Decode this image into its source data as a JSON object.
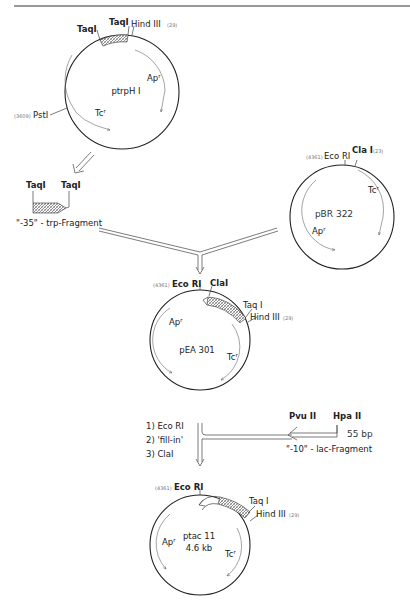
{
  "header": {
    "text": ""
  },
  "plasmids": {
    "ptrpH1": {
      "name": "ptrpH I",
      "sites": {
        "taq1_left": "TaqI",
        "taq1_right": "TaqI",
        "hind3": "Hind III",
        "hind3_pos": "(29)",
        "pst1": "PstI",
        "pst1_pos": "(3609)"
      },
      "genes": {
        "ap": "Ap",
        "tc": "Tc",
        "sup": "r"
      }
    },
    "pBR322": {
      "name": "pBR 322",
      "sites": {
        "ecor1": "Eco RI",
        "ecor1_pos": "(4361)",
        "cla1": "Cla I",
        "cla1_pos": "(23)"
      },
      "genes": {
        "ap": "Ap",
        "tc": "Tc",
        "sup": "r"
      }
    },
    "pEA301": {
      "name": "pEA 301",
      "sites": {
        "ecor1": "Eco RI",
        "ecor1_pos": "(4361)",
        "cla1": "ClaI",
        "taq1": "Taq I",
        "hind3": "Hind III",
        "hind3_pos": "(29)"
      },
      "genes": {
        "ap": "Ap",
        "tc": "Tc",
        "sup": "r"
      }
    },
    "ptac11": {
      "name": "ptac 11",
      "size": "4.6 kb",
      "sites": {
        "ecor1": "Eco RI",
        "ecor1_pos": "(4361)",
        "taq1": "Taq I",
        "hind3": "Hind III",
        "hind3_pos": "(29)"
      },
      "genes": {
        "ap": "Ap",
        "tc": "Tc",
        "sup": "r"
      }
    }
  },
  "fragments": {
    "trp": {
      "left_site": "TaqI",
      "right_site": "TaqI",
      "label": "\"-35\" - trp-Fragment"
    },
    "lac": {
      "left_site": "Pvu II",
      "right_site": "Hpa II",
      "size": "55 bp",
      "label": "\"-10\" - lac-Fragment"
    }
  },
  "steps": [
    "1) Eco RI",
    "2) 'fill-in'",
    "3) ClaI"
  ]
}
